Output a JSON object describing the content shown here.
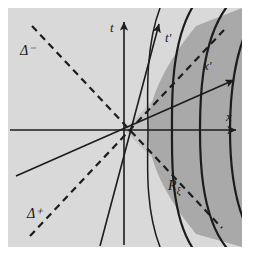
{
  "figure": {
    "kind": "minkowski-spacetime-diagram",
    "background_color": "#ffffff",
    "plot_background_color": "#d9d9d9",
    "shade_color_outer": "#c2c2c2",
    "shade_color_inner": "#a9a9a9",
    "line_color": "#1c1c1c"
  },
  "plot_area": {
    "x": 8,
    "y": 8,
    "width": 234,
    "height": 239,
    "origin_x": 124,
    "origin_y": 130
  },
  "axes": {
    "t": {
      "label": "t",
      "label_x": 112,
      "label_y": 30,
      "x1": 124,
      "y1": 247,
      "x2": 124,
      "y2": 18,
      "arrow": true
    },
    "x": {
      "label": "x",
      "label_x": 228,
      "label_y": 119,
      "x1": 8,
      "y1": 130,
      "x2": 240,
      "y2": 130,
      "arrow": true
    },
    "t_prime": {
      "label": "t′",
      "label_x": 168,
      "label_y": 40,
      "x1": 101,
      "y1": 247,
      "x2": 160,
      "y2": 20,
      "arrow": true
    },
    "x_prime": {
      "label": "x′",
      "label_x": 206,
      "label_y": 68,
      "x1": 18,
      "y1": 172,
      "x2": 238,
      "y2": 78,
      "arrow": true
    }
  },
  "asymptotes": {
    "delta_minus": {
      "label": "Δ⁻",
      "label_x": 24,
      "label_y": 51,
      "x1": 32,
      "y1": 26,
      "x2": 218,
      "y2": 228,
      "dashed": true
    },
    "delta_plus": {
      "label": "Δ⁺",
      "label_x": 30,
      "label_y": 214,
      "x1": 30,
      "y1": 236,
      "x2": 222,
      "y2": 34,
      "dashed": true
    }
  },
  "region": {
    "label": "ℛξ",
    "label_script": "R",
    "label_subscript": "ξ",
    "label_x": 172,
    "label_y": 186,
    "curve_count": 4,
    "description": "family of hyperbolae in the right wedge between the two light-cone asymptotes"
  },
  "curves": [
    {
      "name": "hyperbola-1",
      "a": 24
    },
    {
      "name": "hyperbola-2",
      "a": 48
    },
    {
      "name": "hyperbola-3",
      "a": 74
    },
    {
      "name": "hyperbola-4",
      "a": 100
    }
  ]
}
